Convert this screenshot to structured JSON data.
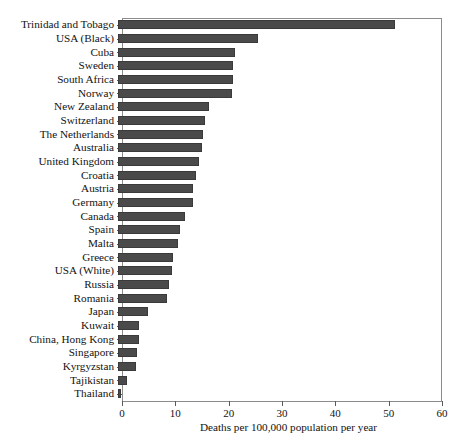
{
  "chart_data": {
    "type": "bar",
    "orientation": "horizontal",
    "title": "",
    "subtitle": "",
    "xlabel": "Deaths per 100,000 population per year",
    "ylabel": "",
    "xlim": [
      0,
      60
    ],
    "xticks": [
      0,
      10,
      20,
      30,
      40,
      50,
      60
    ],
    "grid": false,
    "legend": null,
    "bar_color": "#4a4a4a",
    "categories": [
      "Trinidad and Tobago",
      "USA (Black)",
      "Cuba",
      "Sweden",
      "South Africa",
      "Norway",
      "New Zealand",
      "Switzerland",
      "The Netherlands",
      "Australia",
      "United Kingdom",
      "Croatia",
      "Austria",
      "Germany",
      "Canada",
      "Spain",
      "Malta",
      "Greece",
      "USA (White)",
      "Russia",
      "Romania",
      "Japan",
      "Kuwait",
      "China, Hong Kong",
      "Singapore",
      "Kyrgyzstan",
      "Tajikistan",
      "Thailand"
    ],
    "values": [
      52.0,
      26.2,
      22.0,
      21.5,
      21.5,
      21.3,
      17.0,
      16.3,
      16.0,
      15.8,
      15.2,
      14.7,
      14.0,
      14.0,
      12.6,
      11.6,
      11.2,
      10.4,
      10.2,
      9.5,
      9.2,
      5.6,
      4.0,
      4.0,
      3.6,
      3.4,
      1.6,
      0.6
    ]
  }
}
